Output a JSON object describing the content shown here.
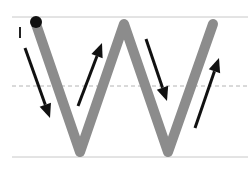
{
  "diagram": {
    "type": "letter-stroke-guide",
    "letter": "W",
    "guide_lines": {
      "top": {
        "y": 17,
        "style": "solid",
        "color": "#c8c8c8"
      },
      "middle": {
        "y": 86,
        "style": "dashed",
        "color": "#b4b4b4"
      },
      "bottom": {
        "y": 157,
        "style": "solid",
        "color": "#c8c8c8"
      }
    },
    "stroke": {
      "color": "#8c8c8c",
      "width": 10,
      "points": [
        [
          36,
          24
        ],
        [
          80,
          152
        ],
        [
          124,
          24
        ],
        [
          168,
          152
        ],
        [
          213,
          24
        ]
      ]
    },
    "start_dot": {
      "x": 36,
      "y": 22,
      "r": 6,
      "color": "#111111"
    },
    "start_marker": {
      "x": 20,
      "y1": 27,
      "y2": 38,
      "color": "#222222"
    },
    "arrows": [
      {
        "from": [
          25,
          48
        ],
        "to": [
          50,
          118
        ],
        "direction": "down"
      },
      {
        "from": [
          78,
          106
        ],
        "to": [
          102,
          43
        ],
        "direction": "up"
      },
      {
        "from": [
          146,
          39
        ],
        "to": [
          167,
          101
        ],
        "direction": "down"
      },
      {
        "from": [
          195,
          128
        ],
        "to": [
          219,
          58
        ],
        "direction": "up"
      }
    ],
    "arrow_color": "#111111"
  }
}
